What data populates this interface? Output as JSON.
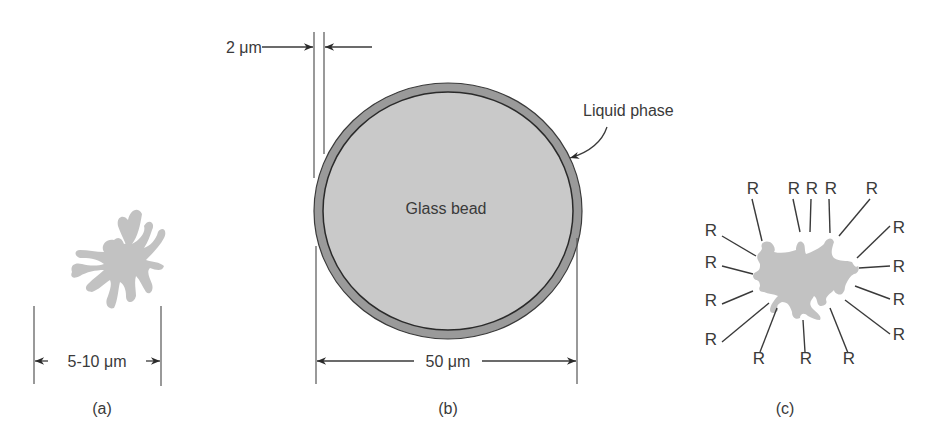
{
  "panels": {
    "a": {
      "caption": "(a)",
      "dimension_label": "5-10 μm",
      "description": "irregular diatomaceous earth particle"
    },
    "b": {
      "caption": "(b)",
      "center_label": "Glass bead",
      "coating_label": "Liquid phase",
      "thickness_label": "2 μm",
      "diameter_label": "50 μm"
    },
    "c": {
      "caption": "(c)",
      "group_label": "R",
      "group_count": 16
    }
  },
  "colors": {
    "particle": "#c2c2c2",
    "bead_fill": "#c9c9c9",
    "liquid_ring": "#9a9a9a",
    "ink": "#3a3a3a"
  }
}
